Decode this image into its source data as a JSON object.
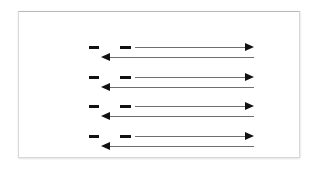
{
  "canvas": {
    "width": 314,
    "height": 170,
    "background": "#ffffff"
  },
  "panel": {
    "name": "diagram-panel",
    "background": "#ffffff",
    "border_color": "#d8d8d8",
    "x": 18,
    "y": 11,
    "width": 282,
    "height": 147
  },
  "diagram": {
    "title": "",
    "stroke_color": "#6f6f6f",
    "marker_color": "#111111",
    "group_count": 4,
    "group_pitch": 30,
    "first_group_top": 28,
    "groups": [
      {
        "id": "group-1",
        "label": "",
        "top": 28,
        "dashes": [
          {
            "id": "dash-1a",
            "label": "",
            "left": 70,
            "width": 10
          },
          {
            "id": "dash-1b",
            "label": "",
            "left": 101,
            "width": 11
          }
        ],
        "forward_arrow": {
          "id": "arrow-right-1",
          "label": "",
          "direction": "right",
          "start": 116,
          "end": 235
        },
        "return_arrow": {
          "id": "arrow-left-1",
          "label": "",
          "direction": "left",
          "start": 235,
          "end": 82
        }
      },
      {
        "id": "group-2",
        "label": "",
        "top": 58,
        "dashes": [
          {
            "id": "dash-2a",
            "label": "",
            "left": 70,
            "width": 10
          },
          {
            "id": "dash-2b",
            "label": "",
            "left": 101,
            "width": 11
          }
        ],
        "forward_arrow": {
          "id": "arrow-right-2",
          "label": "",
          "direction": "right",
          "start": 116,
          "end": 235
        },
        "return_arrow": {
          "id": "arrow-left-2",
          "label": "",
          "direction": "left",
          "start": 235,
          "end": 82
        }
      },
      {
        "id": "group-3",
        "label": "",
        "top": 87,
        "dashes": [
          {
            "id": "dash-3a",
            "label": "",
            "left": 70,
            "width": 10
          },
          {
            "id": "dash-3b",
            "label": "",
            "left": 101,
            "width": 11
          }
        ],
        "forward_arrow": {
          "id": "arrow-right-3",
          "label": "",
          "direction": "right",
          "start": 116,
          "end": 235
        },
        "return_arrow": {
          "id": "arrow-left-3",
          "label": "",
          "direction": "left",
          "start": 235,
          "end": 82
        }
      },
      {
        "id": "group-4",
        "label": "",
        "top": 117,
        "dashes": [
          {
            "id": "dash-4a",
            "label": "",
            "left": 70,
            "width": 10
          },
          {
            "id": "dash-4b",
            "label": "",
            "left": 101,
            "width": 11
          }
        ],
        "forward_arrow": {
          "id": "arrow-right-4",
          "label": "",
          "direction": "right",
          "start": 116,
          "end": 235
        },
        "return_arrow": {
          "id": "arrow-left-4",
          "label": "",
          "direction": "left",
          "start": 235,
          "end": 82
        }
      }
    ]
  }
}
